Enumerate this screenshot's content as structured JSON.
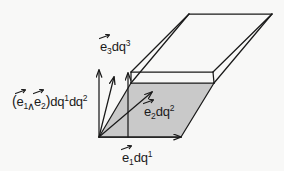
{
  "figure": {
    "background_color": "#f8f8f7",
    "line_color": "#1a1a1a",
    "shaded_face_color": "#c9c9c9",
    "labels": {
      "wedge_area": {
        "open_paren": "(",
        "e_one": "e",
        "sub_one": "1",
        "wedge": "∧",
        "e_two": "e",
        "sub_two": "2",
        "close_paren": ")",
        "dq_one": "dq",
        "sup_one": "1",
        "dq_two": "dq",
        "sup_two": "2"
      },
      "e3": {
        "base": "e",
        "sub": "3",
        "dq": "dq",
        "sup": "3"
      },
      "e2": {
        "base": "e",
        "sub": "2",
        "dq": "dq",
        "sup": "2"
      },
      "e1": {
        "base": "e",
        "sub": "1",
        "dq": "dq",
        "sup": "1"
      }
    },
    "geometry": {
      "origin": [
        99,
        137
      ],
      "base_front_right": [
        181,
        137
      ],
      "base_back_right": [
        214,
        83
      ],
      "base_back_left": [
        131,
        83
      ],
      "top_front_left": [
        131,
        72
      ],
      "top_front_right": [
        213,
        72
      ],
      "top_back_right": [
        272,
        14
      ],
      "top_back_left": [
        189,
        14
      ],
      "e1_arrow_tip": [
        181,
        137
      ],
      "e2_arrow_tip": [
        152,
        92
      ],
      "e3_arrow_tip": [
        128,
        72
      ],
      "wedge_arrow_tip": [
        99,
        70
      ]
    }
  }
}
